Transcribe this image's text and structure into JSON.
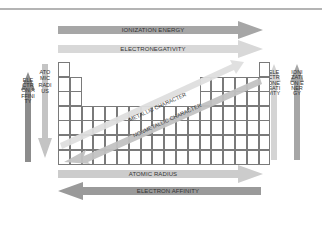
{
  "diagram": {
    "arrows": {
      "top_1": {
        "label": "IONIZATION ENERGY",
        "direction": "right",
        "color": "#a6a6a6"
      },
      "top_2": {
        "label": "ELECTRONEGATIVITY",
        "direction": "right",
        "color": "#d8d8d8"
      },
      "bottom_1": {
        "label": "ATOMIC RADIUS",
        "direction": "right",
        "color": "#cccccc"
      },
      "bottom_2": {
        "label": "ELECTRON AFFINITY",
        "direction": "left",
        "color": "#9a9a9a"
      },
      "left_1": {
        "label": "ELECTRON AFFINITY",
        "direction": "up",
        "color": "#8c8c8c"
      },
      "left_2": {
        "label": "ATOMIC RADIUS",
        "direction": "down",
        "color": "#c4c4c4"
      },
      "right_1": {
        "label": "ELECTRONEGATIVITY",
        "direction": "up",
        "color": "#d4d4d4"
      },
      "right_2": {
        "label": "IONIZATION ENERGY",
        "direction": "up",
        "color": "#a6a6a6"
      },
      "diag_1": {
        "label": "METALLIC CHARACTER",
        "direction": "down-left",
        "color": "#dedede"
      },
      "diag_2": {
        "label": "NONMETALLIC CHARACTER",
        "direction": "down-left",
        "color": "#c2c2c2"
      }
    },
    "table": {
      "columns": 18,
      "rows": 7
    }
  }
}
